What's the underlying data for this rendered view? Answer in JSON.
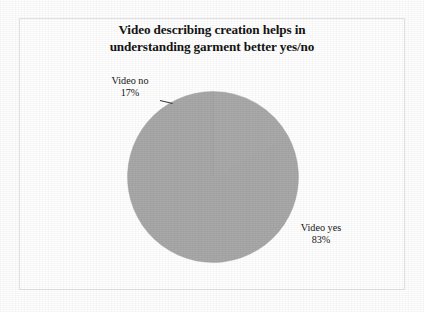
{
  "chart_data": {
    "type": "pie",
    "title": "Video describing creation helps in understanding garment better yes/no",
    "title_lines": [
      "Video describing creation helps in",
      "understanding garment better yes/no"
    ],
    "categories": [
      "Video yes",
      "Video no"
    ],
    "values": [
      83,
      17
    ],
    "value_labels": [
      "83%",
      "17%"
    ],
    "unit": "%",
    "slice_color": "#a8a8a8",
    "legend": "none",
    "labels_position": "outside",
    "annotations": [
      {
        "name": "Video no",
        "value": "17%",
        "position": "upper-left",
        "leader_line": true
      },
      {
        "name": "Video yes",
        "value": "83%",
        "position": "right",
        "leader_line": false
      }
    ],
    "xlabel": "",
    "ylabel": "",
    "grid": false,
    "start_angle_deg": 0,
    "direction": "counterclockwise"
  },
  "figure": {
    "background_color": "#ffffff",
    "frame_color": "#e3e3e3",
    "text_color": "#141414"
  }
}
